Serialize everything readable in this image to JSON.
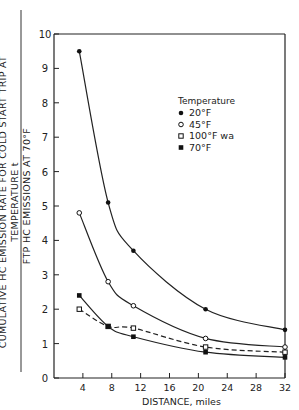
{
  "chart_data": {
    "type": "line",
    "title": "",
    "xlabel": "DISTANCE, miles",
    "ylabel_numerator": "CUMULATIVE HC EMISSION RATE FOR COLD START TRIP AT TEMPERATURE t",
    "ylabel_denominator": "FTP HC EMISSIONS AT 70°F",
    "xlim": [
      0,
      32
    ],
    "ylim": [
      0,
      10
    ],
    "x_ticks": [
      4,
      8,
      12,
      16,
      20,
      24,
      28,
      32
    ],
    "y_ticks": [
      0,
      1,
      2,
      3,
      4,
      5,
      6,
      7,
      8,
      9,
      10
    ],
    "grid": false,
    "legend": {
      "title": "Temperature",
      "position": "upper right (inside)",
      "entries": [
        {
          "label": "20°F",
          "marker": "filled-circle",
          "line": "solid"
        },
        {
          "label": "45°F",
          "marker": "open-circle",
          "line": "solid"
        },
        {
          "label": "100°F wa",
          "marker": "open-square",
          "line": "dashed"
        },
        {
          "label": "70°F",
          "marker": "filled-square",
          "line": "solid"
        }
      ]
    },
    "series": [
      {
        "name": "20°F",
        "x": [
          3.5,
          7.5,
          11,
          21,
          32
        ],
        "y": [
          9.5,
          5.1,
          3.7,
          2.0,
          1.4
        ]
      },
      {
        "name": "45°F",
        "x": [
          3.5,
          7.5,
          11,
          21,
          32
        ],
        "y": [
          4.8,
          2.8,
          2.1,
          1.15,
          0.9
        ]
      },
      {
        "name": "100°F wa",
        "x": [
          3.5,
          7.5,
          11,
          21,
          32
        ],
        "y": [
          2.0,
          1.5,
          1.45,
          0.9,
          0.75
        ]
      },
      {
        "name": "70°F",
        "x": [
          3.5,
          7.5,
          11,
          21,
          32
        ],
        "y": [
          2.4,
          1.5,
          1.2,
          0.75,
          0.6
        ]
      }
    ]
  }
}
